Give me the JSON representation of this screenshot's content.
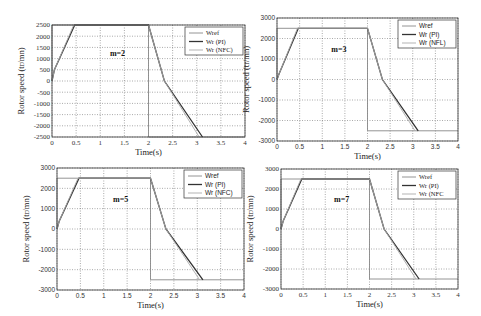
{
  "chart_data": [
    {
      "type": "line",
      "id": "m2",
      "annotation": "m=2",
      "xlabel": "Time(s)",
      "ylabel": "Rotor speed (tr/mn)",
      "xlim": [
        0,
        4
      ],
      "ylim": [
        -2500,
        2500
      ],
      "xticks": [
        "0",
        "0.5",
        "1",
        "1.5",
        "2",
        "2.5",
        "3",
        "3.5",
        "4"
      ],
      "yticks": [
        "2500",
        "2000",
        "1500",
        "1000",
        "500",
        "0",
        "-500",
        "-1000",
        "-1500",
        "-2000",
        "-2500"
      ],
      "ytick_values": [
        2500,
        2000,
        1500,
        1000,
        500,
        0,
        -500,
        -1000,
        -1500,
        -2000,
        -2500
      ],
      "grid": true,
      "legend_position": "upper right",
      "legend": [
        "Wref",
        "Wr (PI)",
        "Wr (NFC)"
      ],
      "series": [
        {
          "name": "Wref",
          "color": "#888888",
          "x": [
            0,
            0,
            2,
            2,
            4
          ],
          "y": [
            0,
            2500,
            2500,
            -2500,
            -2500
          ]
        },
        {
          "name": "Wr (PI)",
          "color": "#333333",
          "x": [
            0,
            0.05,
            0.47,
            2,
            2.33,
            3.12
          ],
          "y": [
            0,
            500,
            2500,
            2500,
            0,
            -2500
          ]
        },
        {
          "name": "Wr (NFC)",
          "color": "#aaaaaa",
          "x": [
            0,
            0.05,
            0.45,
            2,
            2.33,
            3.05
          ],
          "y": [
            0,
            500,
            2500,
            2500,
            0,
            -2500
          ]
        }
      ]
    },
    {
      "type": "line",
      "id": "m3",
      "annotation": "m=3",
      "xlabel": "Time(s)",
      "ylabel": "Rotor speed (tr/mn)",
      "xlim": [
        0,
        4
      ],
      "ylim": [
        -3000,
        3000
      ],
      "xticks": [
        "0",
        "0.5",
        "1",
        "1.5",
        "2",
        "2.5",
        "3",
        "3.5",
        "4"
      ],
      "yticks": [
        "3000",
        "2000",
        "1000",
        "0",
        "-1000",
        "-2000",
        "-3000"
      ],
      "ytick_values": [
        3000,
        2000,
        1000,
        0,
        -1000,
        -2000,
        -3000
      ],
      "grid": true,
      "legend_position": "upper right",
      "legend": [
        "Wref",
        "Wr (PI)",
        "Wr (NFL)"
      ],
      "series": [
        {
          "name": "Wref",
          "color": "#888888",
          "x": [
            0,
            0,
            2,
            2,
            4
          ],
          "y": [
            0,
            2500,
            2500,
            -2500,
            -2500
          ]
        },
        {
          "name": "Wr (PI)",
          "color": "#333333",
          "x": [
            0,
            0.05,
            0.47,
            2,
            2.33,
            3.12
          ],
          "y": [
            0,
            300,
            2500,
            2500,
            0,
            -2500
          ]
        },
        {
          "name": "Wr (NFL)",
          "color": "#aaaaaa",
          "x": [
            0,
            0.05,
            0.45,
            2,
            2.33,
            3.05
          ],
          "y": [
            0,
            300,
            2500,
            2500,
            0,
            -2500
          ]
        }
      ]
    },
    {
      "type": "line",
      "id": "m5",
      "annotation": "m=5",
      "xlabel": "Time(s)",
      "ylabel": "Rotor speed (tr/mn)",
      "xlim": [
        0,
        4
      ],
      "ylim": [
        -3000,
        3000
      ],
      "xticks": [
        "0",
        "0.5",
        "1",
        "1.5",
        "2",
        "2.5",
        "3",
        "3.5",
        "4"
      ],
      "yticks": [
        "3000",
        "2000",
        "1000",
        "0",
        "-1000",
        "-2000",
        "-3000"
      ],
      "ytick_values": [
        3000,
        2000,
        1000,
        0,
        -1000,
        -2000,
        -3000
      ],
      "grid": true,
      "legend_position": "upper right",
      "legend": [
        "Wref",
        "Wr (PI)",
        "Wr (NFC)"
      ],
      "series": [
        {
          "name": "Wref",
          "color": "#888888",
          "x": [
            0,
            0,
            2,
            2,
            4
          ],
          "y": [
            0,
            2500,
            2500,
            -2500,
            -2500
          ]
        },
        {
          "name": "Wr (PI)",
          "color": "#333333",
          "x": [
            0,
            0.05,
            0.47,
            2,
            2.33,
            3.12
          ],
          "y": [
            0,
            400,
            2500,
            2500,
            0,
            -2500
          ]
        },
        {
          "name": "Wr (NFC)",
          "color": "#aaaaaa",
          "x": [
            0,
            0.05,
            0.45,
            2,
            2.33,
            3.05
          ],
          "y": [
            0,
            400,
            2500,
            2500,
            0,
            -2500
          ]
        }
      ]
    },
    {
      "type": "line",
      "id": "m7",
      "annotation": "m=7",
      "xlabel": "Time(s)",
      "ylabel": "Rotor speed (tr/mn)",
      "xlim": [
        0,
        4
      ],
      "ylim": [
        -3000,
        3000
      ],
      "xticks": [
        "0",
        "0.5",
        "1",
        "1.5",
        "2",
        "2.5",
        "3",
        "3.5",
        "4"
      ],
      "yticks": [
        "3000",
        "2000",
        "1000",
        "0",
        "-1000",
        "-2000",
        "-3000"
      ],
      "ytick_values": [
        3000,
        2000,
        1000,
        0,
        -1000,
        -2000,
        -3000
      ],
      "grid": true,
      "legend_position": "upper right",
      "legend": [
        "Wref",
        "Wr (PI)",
        "Wr (NFC"
      ],
      "series": [
        {
          "name": "Wref",
          "color": "#888888",
          "x": [
            0,
            0,
            2,
            2,
            4
          ],
          "y": [
            0,
            2500,
            2500,
            -2500,
            -2500
          ]
        },
        {
          "name": "Wr (PI)",
          "color": "#333333",
          "x": [
            0,
            0.05,
            0.47,
            2,
            2.33,
            3.12
          ],
          "y": [
            0,
            400,
            2500,
            2500,
            0,
            -2500
          ]
        },
        {
          "name": "Wr (NFC)",
          "color": "#aaaaaa",
          "x": [
            0,
            0.05,
            0.45,
            2,
            2.33,
            3.05
          ],
          "y": [
            0,
            400,
            2500,
            2500,
            0,
            -2500
          ]
        }
      ]
    }
  ],
  "layout": {
    "panels": [
      {
        "left": 52,
        "top": 25,
        "width": 193,
        "height": 112,
        "font": "serif"
      },
      {
        "left": 277,
        "top": 18,
        "width": 181,
        "height": 123,
        "font": "sans"
      },
      {
        "left": 57,
        "top": 168,
        "width": 187,
        "height": 122,
        "font": "sans"
      },
      {
        "left": 281,
        "top": 169,
        "width": 177,
        "height": 120,
        "font": "serif"
      }
    ]
  }
}
